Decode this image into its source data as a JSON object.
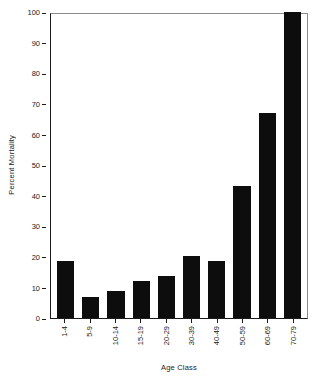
{
  "chart_data": {
    "type": "bar",
    "title": "",
    "subtitle": "",
    "xlabel": "Age Class",
    "ylabel": "Percent Mortality",
    "categories": [
      "1-4",
      "5-9",
      "10-14",
      "15-19",
      "20-29",
      "30-39",
      "40-49",
      "50-59",
      "60-69",
      "70-79"
    ],
    "values": [
      18.6,
      7.0,
      8.7,
      12.2,
      13.8,
      20.2,
      18.6,
      43.0,
      67.0,
      100.0
    ],
    "ylim": [
      0,
      100
    ],
    "xlim_type": "categorical",
    "yticks": [
      0,
      10,
      20,
      30,
      40,
      50,
      60,
      70,
      80,
      90,
      100
    ],
    "ytick_labels": [
      "0",
      "10",
      "20",
      "30",
      "40",
      "50",
      "60",
      "70",
      "80",
      "90",
      "100"
    ],
    "grid": false,
    "legend": null,
    "legend_position": "none",
    "bar_color": "#0d0d0d",
    "axis_color": "#1a1a1a",
    "frame_color": "#8a8a8a",
    "background": "#ffffff",
    "xtick_rotation": 90,
    "annotations": []
  }
}
